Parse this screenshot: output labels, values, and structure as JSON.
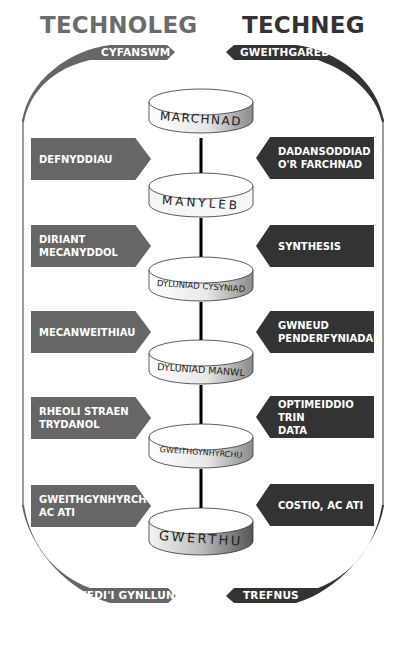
{
  "header": {
    "left_title": "TECHNOLEG",
    "right_title": "TECHNEG"
  },
  "arcs": {
    "top_left": "CYFANSWM",
    "top_right": "GWEITHGAREDD",
    "bottom_left": "WEDI'I GYNLLUNIO",
    "bottom_right": "TREFNUS"
  },
  "stages": [
    {
      "label": "MARCHNAD"
    },
    {
      "label": "MANYLEB"
    },
    {
      "label": "DYLUNIAD CYSYNIAD"
    },
    {
      "label": "DYLUNIAD MANWL"
    },
    {
      "label": "GWEITHGYNHYRCHU"
    },
    {
      "label": "GWERTHU"
    }
  ],
  "left_boxes": [
    {
      "text": "DEFNYDDIAU"
    },
    {
      "text": "DIRIANT\nMECANYDDOL"
    },
    {
      "text": "MECANWEITHIAU"
    },
    {
      "text": "RHEOLI STRAEN\nTRYDANOL"
    },
    {
      "text": "GWEITHGYNHYRCHU,\nAC ATI"
    }
  ],
  "right_boxes": [
    {
      "text": "DADANSODDIAD\nO'R FARCHNAD"
    },
    {
      "text": "SYNTHESIS"
    },
    {
      "text": "GWNEUD\nPENDERFYNIADAU"
    },
    {
      "text": "OPTIMEIDDIO TRIN\nDATA"
    },
    {
      "text": "COSTIO, AC ATI"
    }
  ],
  "colors": {
    "left_fill": "#666666",
    "right_fill": "#333333",
    "arrow": "#000000",
    "left_title": "#6b6b6b",
    "right_title": "#333333"
  }
}
